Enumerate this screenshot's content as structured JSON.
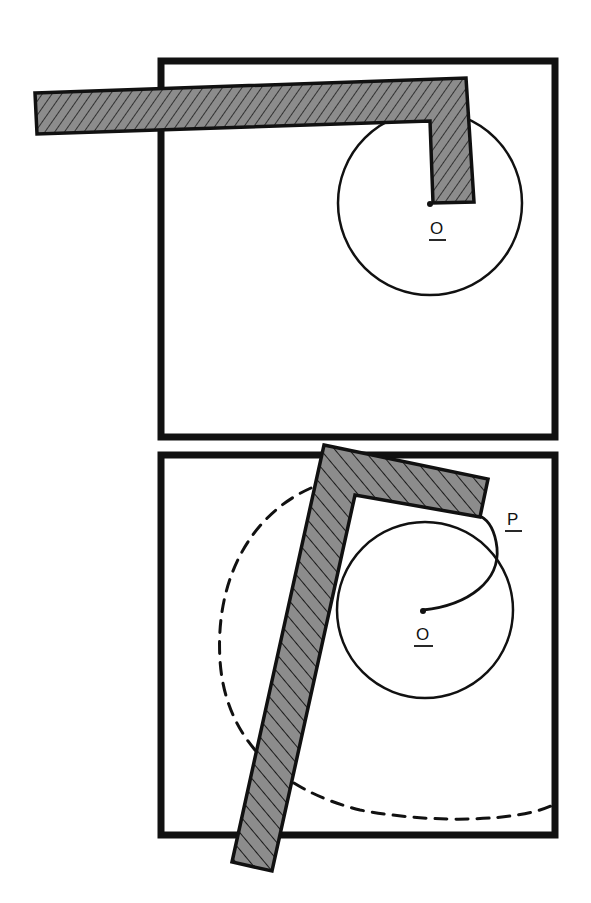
{
  "figure": {
    "panels": [
      {
        "id": "top",
        "description": "L-shaped bar with pivot at O and circle of radius around O",
        "labels": {
          "pivot": "O"
        }
      },
      {
        "id": "bottom",
        "description": "Rotated L-shaped bar; spiral path from O to P; dashed arc swept by bar end",
        "labels": {
          "pivot": "O",
          "point": "P"
        }
      }
    ],
    "colors": {
      "stroke": "#111111",
      "bar_fill": "#8c8c8c",
      "background": "#ffffff"
    }
  }
}
